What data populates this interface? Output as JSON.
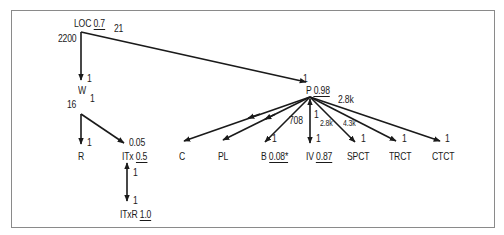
{
  "diagram": {
    "nodes": {
      "LOC": {
        "name": "LOC",
        "value": "0.7"
      },
      "W": {
        "name": "W"
      },
      "R": {
        "name": "R"
      },
      "ITx": {
        "name": "ITx",
        "value": "0.5"
      },
      "ITxR": {
        "name": "ITxR",
        "value": "1.0"
      },
      "P": {
        "name": "P",
        "value": "0.98"
      },
      "C": {
        "name": "C"
      },
      "PL": {
        "name": "PL"
      },
      "B": {
        "name": "B",
        "value": "0.08*"
      },
      "IV": {
        "name": "IV",
        "value": "0.87"
      },
      "SPCT": {
        "name": "SPCT"
      },
      "TRCT": {
        "name": "TRCT"
      },
      "CTCT": {
        "name": "CTCT"
      }
    },
    "edges": {
      "loc_w": {
        "from": "LOC",
        "to": "W",
        "from_label": "2200",
        "to_label": "1"
      },
      "loc_p": {
        "from": "LOC",
        "to": "P",
        "from_label": "21",
        "to_label": "1"
      },
      "w_r": {
        "from": "W",
        "to": "R",
        "from_label": "16",
        "to_label": "1"
      },
      "w_itx": {
        "from": "W",
        "to": "ITx",
        "from_label": "1",
        "to_label": "0.05"
      },
      "itx_itxr": {
        "from": "ITx",
        "to": "ITxR",
        "from_label": "1",
        "to_label": "1"
      },
      "p_c": {
        "from": "P",
        "to": "C"
      },
      "p_pl": {
        "from": "P",
        "to": "PL"
      },
      "p_b": {
        "from": "P",
        "to": "B",
        "from_label": "708",
        "to_label": "1"
      },
      "p_iv": {
        "from": "P",
        "to": "IV",
        "from_label": "1",
        "to_label": "1"
      },
      "p_spct": {
        "from": "P",
        "to": "SPCT",
        "from_label": "2.8k",
        "to_label": "1"
      },
      "p_trct": {
        "from": "P",
        "to": "TRCT",
        "from_label": "4.3k",
        "to_label": "1"
      },
      "p_ctct": {
        "from": "P",
        "to": "CTCT",
        "from_label": "2.8k",
        "to_label": "1"
      }
    }
  }
}
